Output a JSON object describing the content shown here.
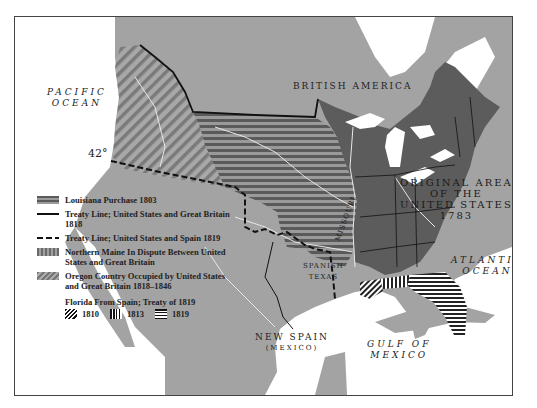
{
  "map": {
    "labels": {
      "pacific_ocean_line1": "PACIFIC",
      "pacific_ocean_line2": "OCEAN",
      "british_america": "BRITISH AMERICA",
      "latitude": "42°",
      "original_area_line1": "ORIGINAL AREA",
      "original_area_line2": "OF THE",
      "original_area_line3": "UNITED STATES",
      "original_area_line4": "1783",
      "atlantic_ocean_line1": "ATLANTIC",
      "atlantic_ocean_line2": "OCEAN",
      "spanish_texas_line1": "SPANISH",
      "spanish_texas_line2": "TEXAS",
      "missouri": "MISSOURI",
      "new_spain": "NEW SPAIN",
      "mexico_paren": "(MEXICO)",
      "gulf_line1": "GULF OF",
      "gulf_line2": "MEXICO"
    },
    "colors": {
      "land": "#a3a3a3",
      "us_original": "#5c5c5c",
      "louisiana_dark": "#5a5a5a",
      "louisiana_light": "#9a9a9a",
      "oregon_stripe": "#7a7a7a",
      "water": "#ffffff",
      "rivers": "#e8e8e8",
      "boundary": "#111111"
    }
  },
  "legend": {
    "items": [
      {
        "label": "Louisiana Purchase 1803"
      },
      {
        "label": "Treaty Line; United States and Great Britain 1818"
      },
      {
        "label": "Treaty Line; United States and Spain 1819"
      },
      {
        "label": "Northern Maine In Dispute Between United States and Great Britain"
      },
      {
        "label": "Oregon Country Occupied by United States and Great Britain 1818–1846"
      }
    ],
    "florida": {
      "title": "Florida From Spain; Treaty of 1819",
      "years": [
        "1810",
        "1813",
        "1819"
      ]
    }
  }
}
